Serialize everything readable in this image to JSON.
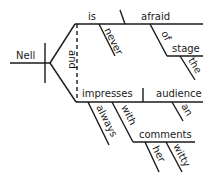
{
  "diagram": {
    "type": "sentence-diagram",
    "subject": "Nell",
    "conjunction": "and",
    "predicate_1": {
      "verb": "is",
      "modifier": "never",
      "complement": "afraid",
      "preposition": "of",
      "object": "stage",
      "object_modifier": "the"
    },
    "predicate_2": {
      "verb": "impresses",
      "modifier": "always",
      "direct_object": "audience",
      "object_modifier": "an",
      "preposition": "with",
      "prep_object": "comments",
      "prep_object_modifiers": [
        "her",
        "witty"
      ]
    },
    "colors": {
      "ink": "#1a1a1a",
      "background": "#ffffff"
    }
  }
}
